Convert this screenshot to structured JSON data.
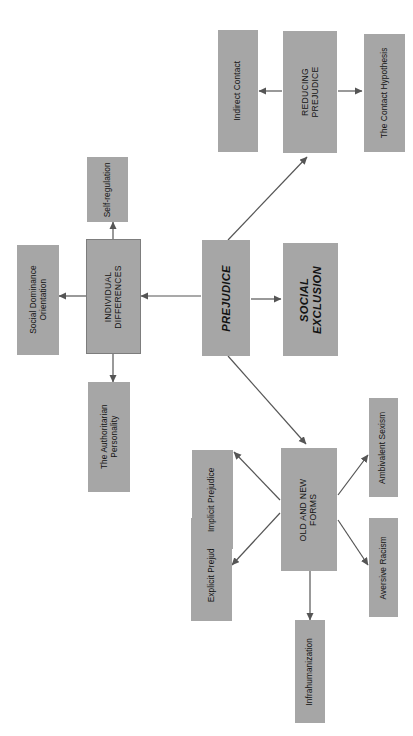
{
  "diagram": {
    "orientation": "rotated-90-ccw",
    "background_color": "#ffffff",
    "node_fill_color": "#a6a6a6",
    "node_border_color": "#7d7d7d",
    "text_color": "#131313",
    "edge_color": "#555555"
  },
  "nodes": {
    "prejudice": "PREJUDICE",
    "social_exclusion": "SOCIAL\nEXCLUSION",
    "individual_differences": "INDIVIDUAL\nDIFFERENCES",
    "social_dominance_orientation": "Social Dominance\nOrientation",
    "self_regulation": "Self-regulation",
    "authoritarian_personality": "The Authoritarian\nPersonality",
    "reducing_prejudice": "REDUCING\nPREJUDICE",
    "indirect_contact": "Indirect Contact",
    "contact_hypothesis": "The Contact Hypothesis",
    "old_and_new_forms": "OLD AND NEW\nFORMS",
    "explicit_prejudice": "Explicit Prejudice",
    "implicit_prejudice": "Implicit Prejudice",
    "ambivalent_sexism": "Ambivalent Sexism",
    "aversive_racism": "Aversive Racism",
    "infrahumanization": "Infrahumanization"
  },
  "edges": [
    {
      "from": "prejudice",
      "to": "individual_differences",
      "arrow": "to"
    },
    {
      "from": "prejudice",
      "to": "social_exclusion",
      "arrow": "to"
    },
    {
      "from": "prejudice",
      "to": "reducing_prejudice",
      "arrow": "to"
    },
    {
      "from": "prejudice",
      "to": "old_and_new_forms",
      "arrow": "to"
    },
    {
      "from": "individual_differences",
      "to": "social_dominance_orientation",
      "arrow": "to"
    },
    {
      "from": "individual_differences",
      "to": "self_regulation",
      "arrow": "to"
    },
    {
      "from": "individual_differences",
      "to": "authoritarian_personality",
      "arrow": "to"
    },
    {
      "from": "reducing_prejudice",
      "to": "indirect_contact",
      "arrow": "to"
    },
    {
      "from": "reducing_prejudice",
      "to": "contact_hypothesis",
      "arrow": "to"
    },
    {
      "from": "old_and_new_forms",
      "to": "explicit_prejudice",
      "arrow": "to"
    },
    {
      "from": "old_and_new_forms",
      "to": "implicit_prejudice",
      "arrow": "to"
    },
    {
      "from": "old_and_new_forms",
      "to": "ambivalent_sexism",
      "arrow": "to"
    },
    {
      "from": "old_and_new_forms",
      "to": "aversive_racism",
      "arrow": "to"
    },
    {
      "from": "old_and_new_forms",
      "to": "infrahumanization",
      "arrow": "to"
    }
  ]
}
